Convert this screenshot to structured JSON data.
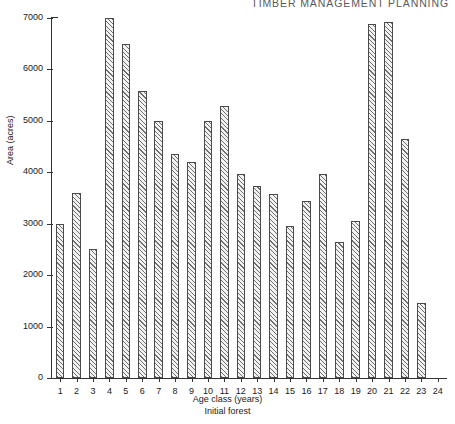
{
  "page": {
    "running_header": "TIMBER MANAGEMENT PLANNING"
  },
  "chart_data": {
    "type": "bar",
    "title": "",
    "subtitle": "",
    "xlabel": "Age class (years)",
    "xlabel_secondary": "Initial forest",
    "ylabel": "Area (acres)",
    "ylim": [
      0,
      7000
    ],
    "ytick_step": 1000,
    "ytick_labels": [
      "0",
      "1000",
      "2000",
      "3000",
      "4000",
      "5000",
      "6000",
      "7000"
    ],
    "ytick_values": [
      0,
      1000,
      2000,
      3000,
      4000,
      5000,
      6000,
      7000
    ],
    "grid": false,
    "legend": null,
    "bar_style": {
      "fill": "#f2f2f2",
      "hatch": "diagonal-45",
      "hatch_color": "#6f6f6f",
      "edge_color": "#4a4a4a"
    },
    "categories": [
      "1",
      "2",
      "3",
      "4",
      "5",
      "6",
      "7",
      "8",
      "9",
      "10",
      "11",
      "12",
      "13",
      "14",
      "15",
      "16",
      "17",
      "18",
      "19",
      "20",
      "21",
      "22",
      "23",
      "24"
    ],
    "values": [
      3000,
      3600,
      2500,
      7000,
      6500,
      5580,
      5000,
      4350,
      4200,
      5000,
      5290,
      3960,
      3740,
      3580,
      2960,
      3440,
      3970,
      2640,
      3050,
      6880,
      6920,
      4650,
      1460,
      0
    ]
  }
}
